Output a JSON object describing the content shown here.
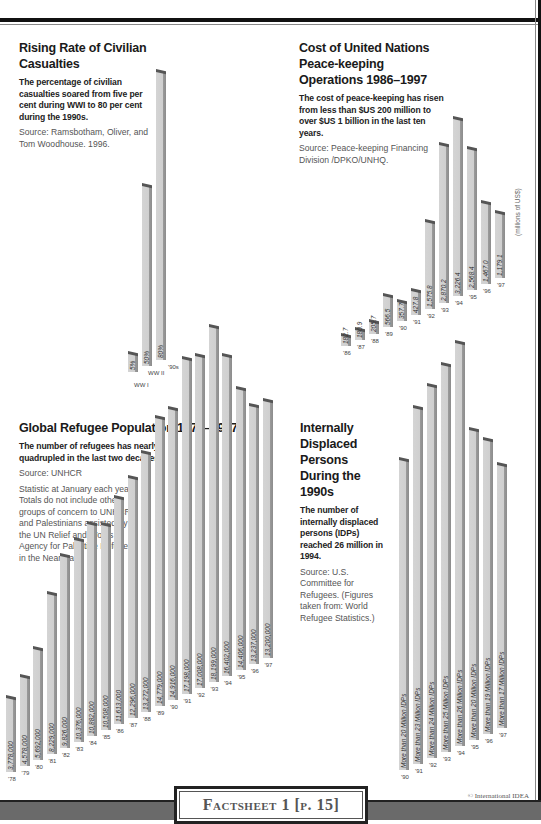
{
  "footer": {
    "factsheet_label": "Factsheet 1 [p. 15]",
    "copyright": "© International IDEA"
  },
  "chart_data": [
    {
      "id": "civilian",
      "type": "bar",
      "title": "Rising Rate of Civilian Casualties",
      "subtitle": "The percentage of civilian casualties soared from five per cent during WWI to 80 per cent during the 1990s.",
      "source": "Source: Ramsbotham, Oliver, and Tom Woodhouse. 1996.",
      "notes": "",
      "unit_label": "",
      "categories": [
        "WW I",
        "WW II",
        "'90s"
      ],
      "values": [
        5,
        50,
        80
      ],
      "value_labels": [
        "5%",
        "50%",
        "80%"
      ],
      "xlabel": "",
      "ylabel": "",
      "ylim": [
        0,
        100
      ],
      "grid": false
    },
    {
      "id": "peacekeeping",
      "type": "bar",
      "title": "Cost of United Nations Peace-keeping Operations 1986–1997",
      "subtitle": "The cost of peace-keeping has risen from less than $US 200 million to over $US 1 billion in the last ten years.",
      "source": "Source: Peace-keeping Financing Division /DPKO/UNHQ.",
      "notes": "",
      "unit_label": "(millions of US$)",
      "categories": [
        "'86",
        "'87",
        "'88",
        "'89",
        "'90",
        "'91",
        "'92",
        "'93",
        "'94",
        "'95",
        "'96",
        "'97"
      ],
      "values": [
        182.7,
        180.9,
        205.7,
        566.5,
        357.7,
        427.8,
        1575.8,
        2870.2,
        3226.4,
        2568.4,
        1467.0,
        1179.1
      ],
      "value_labels": [
        "182.7",
        "180.9",
        "205.7",
        "566.5",
        "357.7",
        "427.8",
        "1,575.8",
        "2,870.2",
        "3,226.4",
        "2,568.4",
        "1,467.0",
        "1,179.1"
      ],
      "xlabel": "",
      "ylabel": "millions of US$",
      "ylim": [
        0,
        3500
      ],
      "grid": false
    },
    {
      "id": "refugees",
      "type": "bar",
      "title": "Global Refugee Population 1978–1997",
      "subtitle": "The number of refugees has nearly quadrupled in the last two decades.",
      "source": "Source: UNHCR",
      "notes": "Statistic at January each year. Totals do not include other groups of concern to UNHCR and Palestinians assisted by the UN Relief and Works Agency for Palestine Refugees in the Near East.",
      "unit_label": "",
      "categories": [
        "'78",
        "'79",
        "'80",
        "'81",
        "'82",
        "'83",
        "'84",
        "'85",
        "'86",
        "'87",
        "'88",
        "'89",
        "'90",
        "'91",
        "'92",
        "'93",
        "'94",
        "'95",
        "'96",
        "'97"
      ],
      "values": [
        3778000,
        4578000,
        5692000,
        8229000,
        9826000,
        10376000,
        10882000,
        10508000,
        11613000,
        12296000,
        13272000,
        14779000,
        14916000,
        17198000,
        17008000,
        18199000,
        16402000,
        14406000,
        13237000,
        13200000
      ],
      "value_labels": [
        "3,778,000",
        "4,578,000",
        "5,692,000",
        "8,229,000",
        "9,826,000",
        "10,376,000",
        "10,882,000",
        "10,508,000",
        "11,613,000",
        "12,296,000",
        "13,272,000",
        "14,779,000",
        "14,916,000",
        "17,198,000",
        "17,008,000",
        "18,199,000",
        "16,402,000",
        "14,406,000",
        "13,237,000",
        "13,200,000"
      ],
      "xlabel": "",
      "ylabel": "",
      "ylim": [
        0,
        20000000
      ],
      "grid": false
    },
    {
      "id": "idps",
      "type": "bar",
      "title": "Internally Displaced Persons During the 1990s",
      "subtitle": "The number of internally displaced persons (IDPs) reached 26 million in 1994.",
      "source": "Source: U.S. Committee for Refugees. (Figures taken from: World Refugee Statistics.)",
      "notes": "",
      "unit_label": "",
      "categories": [
        "'90",
        "'91",
        "'92",
        "'93",
        "'94",
        "'95",
        "'96",
        "'97"
      ],
      "values": [
        20,
        23,
        24,
        25,
        26,
        20,
        19,
        17
      ],
      "value_labels": [
        "More than 20 Million IDPs",
        "More than 23 Million IDPs",
        "More than 24 Million IDPs",
        "More than 25 Million IDPs",
        "More than 26 Million IDPs",
        "More than 20 Million IDPs",
        "More than 19 Million IDPs",
        "More than 17 Million IDPs"
      ],
      "xlabel": "",
      "ylabel": "Million IDPs",
      "ylim": [
        0,
        30
      ],
      "grid": false
    }
  ]
}
